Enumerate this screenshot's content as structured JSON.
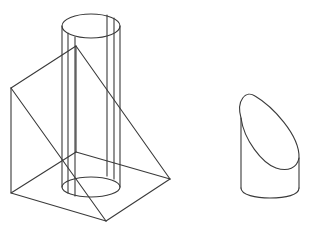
{
  "diagram": {
    "stroke_color": "#3a3a3a",
    "background": "#ffffff",
    "objects": [
      {
        "name": "wedge",
        "type": "triangular-prism-wireframe"
      },
      {
        "name": "cylinder",
        "type": "vertical-cylinder-wireframe"
      },
      {
        "name": "cut-cylinder",
        "type": "oblique-truncated-cylinder"
      }
    ]
  }
}
